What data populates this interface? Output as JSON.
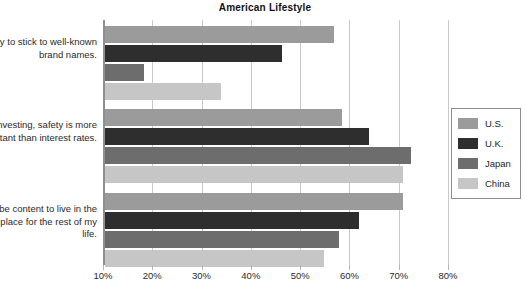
{
  "chart": {
    "title": "American Lifestyle"
  },
  "legend": {
    "position": "right",
    "items": [
      {
        "label": "U.S.",
        "color": "#9b9b9b"
      },
      {
        "label": "U.K.",
        "color": "#2e2e2e"
      },
      {
        "label": "Japan",
        "color": "#6d6d6d"
      },
      {
        "label": "China",
        "color": "#c6c6c6"
      }
    ]
  },
  "xaxis": {
    "ticks": [
      "10%",
      "20%",
      "30%",
      "40%",
      "50%",
      "60%",
      "70%",
      "80%"
    ],
    "values": [
      10,
      20,
      30,
      40,
      50,
      60,
      70,
      80
    ],
    "min": 10,
    "max": 80
  },
  "categories": [
    "I try to stick to well-known brand names.",
    "When investing, safety is more important than interest rates.",
    "I would be content to live in the same place for the rest of my life."
  ],
  "chart_data": {
    "type": "bar",
    "orientation": "horizontal",
    "title": "American Lifestyle",
    "xlabel": "",
    "ylabel": "",
    "xlim": [
      10,
      80
    ],
    "grid": true,
    "legend_position": "right",
    "categories": [
      "I try to stick to well-known brand names.",
      "When investing, safety is more important than interest rates.",
      "I would be content to live in the same place for the rest of my life."
    ],
    "series": [
      {
        "name": "U.S.",
        "color": "#9b9b9b",
        "values": [
          56.5,
          58.0,
          70.5
        ]
      },
      {
        "name": "U.K.",
        "color": "#2e2e2e",
        "values": [
          46.0,
          63.5,
          61.5
        ]
      },
      {
        "name": "Japan",
        "color": "#6d6d6d",
        "values": [
          18.0,
          72.0,
          57.5
        ]
      },
      {
        "name": "China",
        "color": "#c6c6c6",
        "values": [
          33.5,
          70.5,
          54.5
        ]
      }
    ]
  }
}
